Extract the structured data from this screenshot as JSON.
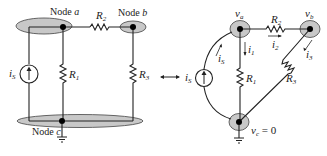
{
  "left_circuit": {
    "node_a_label": "Node ",
    "node_a_var": "a",
    "node_b_label": "Node ",
    "node_b_var": "b",
    "node_c_label": "Node ",
    "node_c_var": "c",
    "r1": {
      "main": "R",
      "sub": "1"
    },
    "r2": {
      "main": "R",
      "sub": "2"
    },
    "r3": {
      "main": "R",
      "sub": "3"
    },
    "source": {
      "main": "i",
      "sub": "S"
    }
  },
  "equivalence_arrow": "double-headed-arrow",
  "right_circuit": {
    "va": {
      "main": "v",
      "sub": "a"
    },
    "vb": {
      "main": "v",
      "sub": "b"
    },
    "vc": {
      "main": "v",
      "sub": "c",
      "eq": " = 0"
    },
    "r1": {
      "main": "R",
      "sub": "1"
    },
    "r2": {
      "main": "R",
      "sub": "2"
    },
    "r3": {
      "main": "R",
      "sub": "3"
    },
    "source": {
      "main": "i",
      "sub": "S"
    },
    "currents": {
      "i1": {
        "main": "i",
        "sub": "1"
      },
      "i2": {
        "main": "i",
        "sub": "2"
      },
      "i3": {
        "main": "i",
        "sub": "3"
      },
      "is": {
        "main": "i",
        "sub": "S"
      }
    }
  },
  "colors": {
    "wire": "#222222",
    "node_fill": "#c8c8c8",
    "node_dot": "#000000"
  }
}
